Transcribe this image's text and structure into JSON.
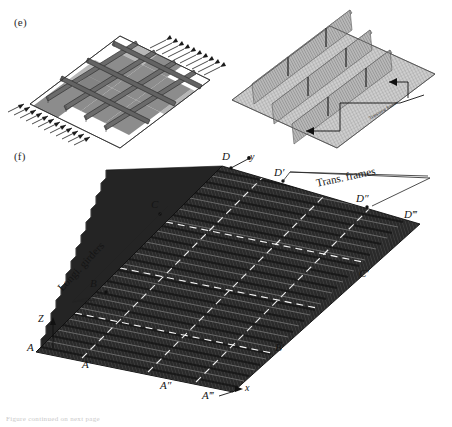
{
  "figure": {
    "panels": [
      {
        "id": "e",
        "label": "(e)",
        "x": 14,
        "y": 16
      },
      {
        "id": "f",
        "label": "(f)",
        "x": 14,
        "y": 150
      }
    ],
    "bottom_caption": "Figure continued on next page"
  },
  "panel_e": {
    "left_diagram": {
      "name": "grillage-plate-model",
      "description": "Isometric stiffened plate grillage with shaded panels, longitudinal and transverse girders, hatched boundary supports",
      "panel_fill": "#8e8e8e",
      "girder_fill": "#6f6f6f",
      "outline": "#222222"
    },
    "right_diagram": {
      "name": "fe-mesh-model",
      "description": "Isometric finite element mesh of deck with three raised transverse frame ridges",
      "mesh_stroke": "#777777",
      "plate_fill": "#c8c8c8",
      "ridge_fill": "#a8a8a8"
    },
    "annotation": {
      "text": "Transverse frames",
      "leader_color": "#111111"
    }
  },
  "panel_f": {
    "model": {
      "name": "corrugated-deck-3d",
      "surface_fill": "#2a2a2a",
      "corrugation_stroke": "#6a6a6a",
      "grid_dash_color": "#f2f2f2",
      "edge_stroke": "#111111"
    },
    "axes": [
      {
        "name": "x",
        "label": "x"
      },
      {
        "name": "y",
        "label": "y"
      },
      {
        "name": "z",
        "label": "Z"
      }
    ],
    "callouts": [
      {
        "name": "longitudinal-girders",
        "text": "Longi. girders",
        "rotation": -47
      },
      {
        "name": "transverse-frames",
        "text": "Trans. frames",
        "rotation": -12
      }
    ],
    "node_labels": [
      {
        "name": "node-A",
        "text": "A",
        "x": 27,
        "y": 348
      },
      {
        "name": "node-A1",
        "text": "A′",
        "x": 82,
        "y": 365
      },
      {
        "name": "node-A2",
        "text": "A″",
        "x": 160,
        "y": 386
      },
      {
        "name": "node-A3",
        "text": "A‴",
        "x": 204,
        "y": 398
      },
      {
        "name": "node-B",
        "text": "B",
        "x": 90,
        "y": 284
      },
      {
        "name": "node-B1",
        "text": "B′",
        "x": 274,
        "y": 348
      },
      {
        "name": "node-C",
        "text": "C",
        "x": 151,
        "y": 205
      },
      {
        "name": "node-C1",
        "text": "C′",
        "x": 358,
        "y": 274
      },
      {
        "name": "node-D",
        "text": "D",
        "x": 225,
        "y": 157
      },
      {
        "name": "node-D1",
        "text": "D′",
        "x": 276,
        "y": 173
      },
      {
        "name": "node-D2",
        "text": "D″",
        "x": 357,
        "y": 199
      },
      {
        "name": "node-D3",
        "text": "D‴",
        "x": 404,
        "y": 215
      }
    ]
  }
}
